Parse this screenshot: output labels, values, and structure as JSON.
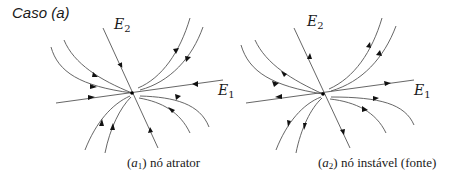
{
  "title": "Caso (a)",
  "colors": {
    "line": "#555555",
    "arrow": "#111111",
    "text": "#1a1a1a"
  },
  "panels": [
    {
      "id": "a1",
      "caption_tag": "a",
      "caption_sub": "1",
      "caption_text": "nó atrator",
      "node_type": "attractor",
      "node": [
        132,
        93
      ],
      "eigen_labels": {
        "E2": {
          "base": "E",
          "sub": "2"
        },
        "E1": {
          "base": "E",
          "sub": "1"
        }
      }
    },
    {
      "id": "a2",
      "caption_tag": "a",
      "caption_sub": "2",
      "caption_text": "nó instável (fonte)",
      "node_type": "source",
      "node": [
        323,
        94
      ],
      "eigen_labels": {
        "E2": {
          "base": "E",
          "sub": "2"
        },
        "E1": {
          "base": "E",
          "sub": "1"
        }
      }
    }
  ]
}
